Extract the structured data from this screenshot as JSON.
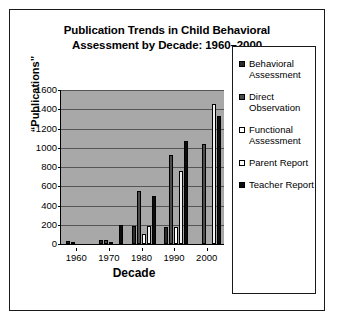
{
  "figure": {
    "title_line1": "Publication Trends in Child Behavioral",
    "title_line2": "Assessment by Decade: 1960–2000"
  },
  "chart_data": {
    "type": "bar",
    "title": "Publication Trends in Child Behavioral Assessment by Decade: 1960–2000",
    "xlabel": "Decade",
    "ylabel": "“Publications”",
    "categories": [
      "1960",
      "1970",
      "1980",
      "1990",
      "2000"
    ],
    "ylim": [
      0,
      1600
    ],
    "yticks": [
      0,
      200,
      400,
      600,
      800,
      1000,
      1200,
      1400,
      1600
    ],
    "ytick_labels": [
      "0",
      "200",
      "400",
      "600",
      "800",
      "1000",
      "1200",
      "1400",
      "1600"
    ],
    "grid": true,
    "legend_position": "right",
    "plot_background": "#a8a8a8",
    "series": [
      {
        "name": "Behavioral Assessment",
        "swatch": "sw-dark",
        "color": "#2b2b2b",
        "values": [
          35,
          45,
          190,
          180,
          0
        ]
      },
      {
        "name": "Direct Observation",
        "swatch": "sw-mid",
        "color": "#4d4d4d",
        "values": [
          20,
          40,
          550,
          930,
          1040
        ]
      },
      {
        "name": "Functional Assessment",
        "swatch": "sw-white",
        "color": "#ffffff",
        "values": [
          0,
          20,
          100,
          180,
          0
        ]
      },
      {
        "name": "Parent Report",
        "swatch": "sw-light",
        "color": "#ffffff",
        "values": [
          0,
          0,
          190,
          760,
          1450
        ]
      },
      {
        "name": "Teacher Report",
        "swatch": "sw-black",
        "color": "#0d0d0d",
        "values": [
          0,
          200,
          500,
          1070,
          1330
        ]
      }
    ]
  }
}
